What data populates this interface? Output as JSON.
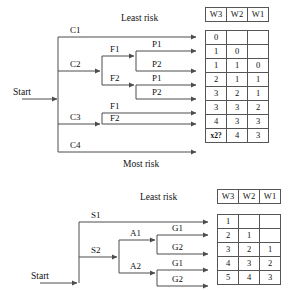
{
  "figure": {
    "title_top_least": "Least risk",
    "title_top_most": "Most risk",
    "title_bottom_least": "Least risk"
  },
  "top_diagram": {
    "start_label": "Start",
    "branches": [
      {
        "label": "C1"
      },
      {
        "label": "C2"
      },
      {
        "label": "C3"
      },
      {
        "label": "C4"
      }
    ],
    "mid_nodes": [
      {
        "label": "F1"
      },
      {
        "label": "F2"
      },
      {
        "label": "F1"
      },
      {
        "label": "F2"
      }
    ],
    "leaf_nodes": [
      {
        "label": "P1"
      },
      {
        "label": "P2"
      },
      {
        "label": "P1"
      },
      {
        "label": "P2"
      }
    ],
    "table": {
      "headers": [
        "W3",
        "W2",
        "W1"
      ],
      "rows": [
        [
          "0",
          "",
          ""
        ],
        [
          "1",
          "0",
          ""
        ],
        [
          "1",
          "1",
          "0"
        ],
        [
          "2",
          "1",
          "1"
        ],
        [
          "3",
          "2",
          "1"
        ],
        [
          "3",
          "3",
          "2"
        ],
        [
          "4",
          "3",
          "3"
        ],
        [
          "x2?",
          "4",
          "3"
        ]
      ]
    }
  },
  "bottom_diagram": {
    "start_label": "Start",
    "branches": [
      {
        "label": "S1"
      },
      {
        "label": "S2"
      }
    ],
    "mid_nodes": [
      {
        "label": "A1"
      },
      {
        "label": "A2"
      }
    ],
    "leaf_nodes": [
      {
        "label": "G1"
      },
      {
        "label": "G2"
      },
      {
        "label": "G1"
      },
      {
        "label": "G2"
      }
    ],
    "table": {
      "headers": [
        "W3",
        "W2",
        "W1"
      ],
      "rows": [
        [
          "1",
          "",
          ""
        ],
        [
          "2",
          "1",
          ""
        ],
        [
          "3",
          "2",
          "1"
        ],
        [
          "4",
          "3",
          "2"
        ],
        [
          "5",
          "4",
          "3"
        ]
      ]
    }
  },
  "style": {
    "line_color": "#4d4d4d",
    "border_color": "#555555",
    "text_color": "#111111",
    "background": "#ffffff"
  }
}
